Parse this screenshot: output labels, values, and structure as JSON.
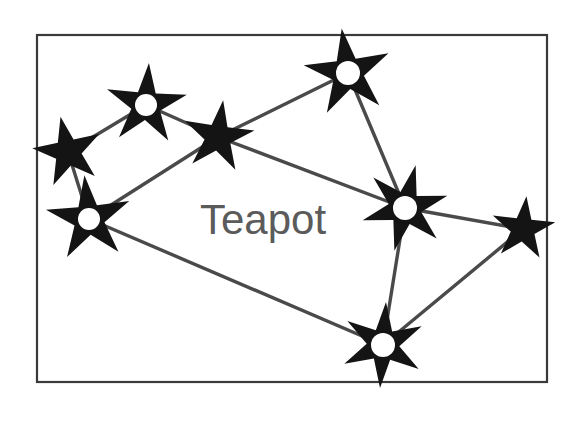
{
  "figure": {
    "label": "Teapot",
    "label_color": "#5b5b5b",
    "frame_color": "#3a3a3a",
    "line_color": "#4a4a4a",
    "star_color": "#141414",
    "star_core_color": "#ffffff",
    "background_color": "#ffffff",
    "frame": {
      "x": 36,
      "y": 34,
      "width": 512,
      "height": 349
    },
    "label_position": {
      "x": 200,
      "y": 234
    }
  },
  "chart_data": {
    "type": "scatter",
    "title": "Teapot",
    "xlabel": "",
    "ylabel": "",
    "xlim": [
      36,
      548
    ],
    "ylim": [
      34,
      383
    ],
    "grid": false,
    "legend": "none",
    "annotations": [
      {
        "text": "Teapot",
        "x": 270,
        "y": 218
      }
    ],
    "nodes": [
      {
        "id": "s1",
        "name": "star-far-left-upper",
        "x": 68,
        "y": 152,
        "points": 5,
        "radius": 36,
        "inner_ratio": 0.38,
        "rotation": -12,
        "core": false,
        "core_radius": 0
      },
      {
        "id": "s2",
        "name": "star-upper-left",
        "x": 146,
        "y": 105,
        "points": 5,
        "radius": 42,
        "inner_ratio": 0.36,
        "rotation": 4,
        "core": true,
        "core_radius": 11
      },
      {
        "id": "s3",
        "name": "star-lower-left",
        "x": 89,
        "y": 219,
        "points": 5,
        "radius": 44,
        "inner_ratio": 0.36,
        "rotation": -6,
        "core": true,
        "core_radius": 11
      },
      {
        "id": "s4",
        "name": "star-mid-upper",
        "x": 218,
        "y": 137,
        "points": 5,
        "radius": 37,
        "inner_ratio": 0.37,
        "rotation": 8,
        "core": false,
        "core_radius": 0
      },
      {
        "id": "s5",
        "name": "star-top",
        "x": 348,
        "y": 73,
        "points": 5,
        "radius": 45,
        "inner_ratio": 0.36,
        "rotation": -8,
        "core": true,
        "core_radius": 12
      },
      {
        "id": "s6",
        "name": "star-mid-right",
        "x": 405,
        "y": 208,
        "points": 6,
        "radius": 44,
        "inner_ratio": 0.38,
        "rotation": 14,
        "core": true,
        "core_radius": 12
      },
      {
        "id": "s7",
        "name": "star-far-right",
        "x": 523,
        "y": 229,
        "points": 5,
        "radius": 33,
        "inner_ratio": 0.38,
        "rotation": 6,
        "core": false,
        "core_radius": 0
      },
      {
        "id": "s8",
        "name": "star-bottom",
        "x": 383,
        "y": 345,
        "points": 6,
        "radius": 43,
        "inner_ratio": 0.38,
        "rotation": 4,
        "core": true,
        "core_radius": 12
      }
    ],
    "edges": [
      {
        "from": "s1",
        "to": "s2",
        "name": "line-far-left-to-upper-left"
      },
      {
        "from": "s1",
        "to": "s3",
        "name": "line-far-left-to-lower-left"
      },
      {
        "from": "s2",
        "to": "s4",
        "name": "line-upper-left-to-mid-upper"
      },
      {
        "from": "s3",
        "to": "s4",
        "name": "line-lower-left-to-mid-upper"
      },
      {
        "from": "s4",
        "to": "s5",
        "name": "line-mid-upper-to-top"
      },
      {
        "from": "s4",
        "to": "s6",
        "name": "line-mid-upper-to-mid-right"
      },
      {
        "from": "s5",
        "to": "s6",
        "name": "line-top-to-mid-right"
      },
      {
        "from": "s3",
        "to": "s8",
        "name": "line-lower-left-to-bottom"
      },
      {
        "from": "s6",
        "to": "s8",
        "name": "line-mid-right-to-bottom"
      },
      {
        "from": "s6",
        "to": "s7",
        "name": "line-mid-right-to-far-right"
      },
      {
        "from": "s7",
        "to": "s8",
        "name": "line-far-right-to-bottom"
      }
    ]
  }
}
